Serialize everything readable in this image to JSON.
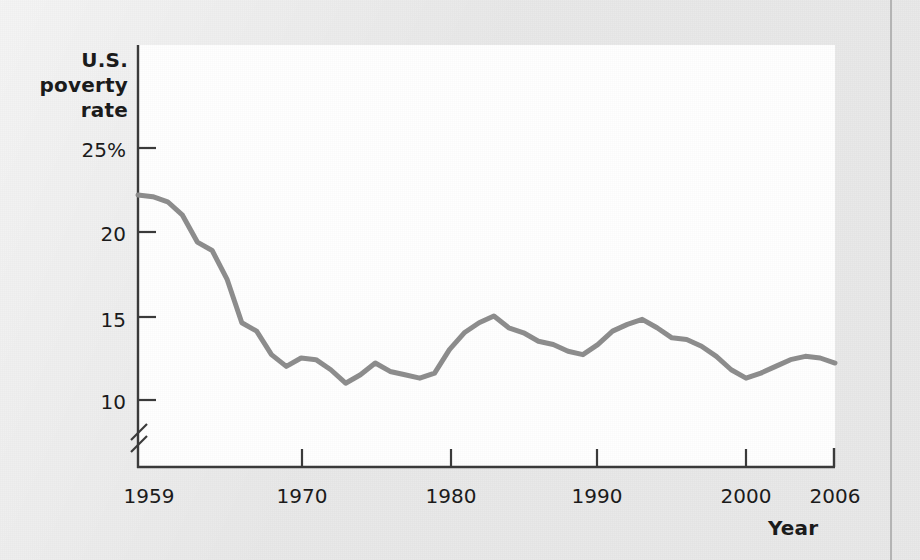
{
  "figure": {
    "background_color": "#e8e8e8",
    "plot_background_color": "#ffffff",
    "line_color": "#8c8c8c",
    "axis_color": "#3a3a3a",
    "text_color": "#1b1b1b"
  },
  "labels": {
    "y_axis_title_line1": "U.S.",
    "y_axis_title_line2": "poverty",
    "y_axis_title_line3": "rate",
    "x_axis_title": "Year"
  },
  "axes": {
    "y_tick_labels": [
      "25%",
      "20",
      "15",
      "10"
    ],
    "y_tick_values": [
      25,
      20,
      15,
      10
    ],
    "x_tick_labels": [
      "1959",
      "1970",
      "1980",
      "1990",
      "2000",
      "2006"
    ],
    "x_tick_values": [
      1959,
      1970,
      1980,
      1990,
      2000,
      2006
    ],
    "y_axis_break": true,
    "y_axis_break_symbol": "//"
  },
  "chart_data": {
    "type": "line",
    "title": "",
    "subtitle": "",
    "xlabel": "Year",
    "ylabel": "U.S. poverty rate",
    "xlim": [
      1959,
      2006
    ],
    "ylim": [
      8.5,
      26.5
    ],
    "grid": false,
    "legend": false,
    "axis_break_below": 10,
    "x": [
      1959,
      1960,
      1961,
      1962,
      1963,
      1964,
      1965,
      1966,
      1967,
      1968,
      1969,
      1970,
      1971,
      1972,
      1973,
      1974,
      1975,
      1976,
      1977,
      1978,
      1979,
      1980,
      1981,
      1982,
      1983,
      1984,
      1985,
      1986,
      1987,
      1988,
      1989,
      1990,
      1991,
      1992,
      1993,
      1994,
      1995,
      1996,
      1997,
      1998,
      1999,
      2000,
      2001,
      2002,
      2003,
      2004,
      2005,
      2006
    ],
    "values": [
      22.2,
      22.1,
      21.8,
      21.0,
      19.4,
      18.9,
      17.2,
      14.6,
      14.1,
      12.7,
      12.0,
      12.5,
      12.4,
      11.8,
      11.0,
      11.5,
      12.2,
      11.7,
      11.5,
      11.3,
      11.6,
      13.0,
      14.0,
      14.6,
      15.0,
      14.3,
      14.0,
      13.5,
      13.3,
      12.9,
      12.7,
      13.3,
      14.1,
      14.5,
      14.8,
      14.3,
      13.7,
      13.6,
      13.2,
      12.6,
      11.8,
      11.3,
      11.6,
      12.0,
      12.4,
      12.6,
      12.5,
      12.2
    ],
    "series": [
      {
        "name": "U.S. poverty rate",
        "color": "#8c8c8c",
        "line_width": 5,
        "values": [
          22.2,
          22.1,
          21.8,
          21.0,
          19.4,
          18.9,
          17.2,
          14.6,
          14.1,
          12.7,
          12.0,
          12.5,
          12.4,
          11.8,
          11.0,
          11.5,
          12.2,
          11.7,
          11.5,
          11.3,
          11.6,
          13.0,
          14.0,
          14.6,
          15.0,
          14.3,
          14.0,
          13.5,
          13.3,
          12.9,
          12.7,
          13.3,
          14.1,
          14.5,
          14.8,
          14.3,
          13.7,
          13.6,
          13.2,
          12.6,
          11.8,
          11.3,
          11.6,
          12.0,
          12.4,
          12.6,
          12.5,
          12.2
        ]
      }
    ]
  }
}
